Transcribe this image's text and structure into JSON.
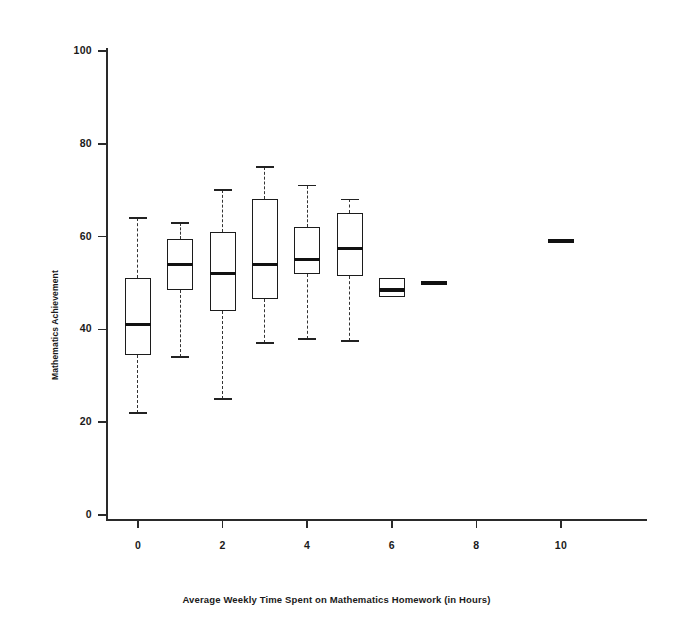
{
  "chart_data": {
    "type": "box",
    "title": "",
    "xlabel": "Average Weekly Time Spent on Mathematics Homework (in Hours)",
    "ylabel": "Mathematics Achievement",
    "xlim": [
      -0.7,
      10.7
    ],
    "ylim": [
      0,
      104
    ],
    "grid": false,
    "legend": null,
    "xticks": [
      0,
      2,
      4,
      6,
      8,
      10
    ],
    "xtick_labels": [
      "0",
      "2",
      "4",
      "6",
      "8",
      "10"
    ],
    "yticks": [
      0,
      20,
      40,
      60,
      80,
      100
    ],
    "ytick_labels": [
      "0",
      "20",
      "40",
      "60",
      "80",
      "100"
    ],
    "categories": [
      "0",
      "1",
      "2",
      "3",
      "4",
      "5",
      "6",
      "7",
      "10"
    ],
    "boxes": [
      {
        "x": 0,
        "whisker_low": 22,
        "q1": 34.5,
        "median": 41,
        "q3": 51,
        "whisker_high": 64,
        "degenerate": false
      },
      {
        "x": 1,
        "whisker_low": 34,
        "q1": 48.5,
        "median": 54,
        "q3": 59.5,
        "whisker_high": 63,
        "degenerate": false
      },
      {
        "x": 2,
        "whisker_low": 25,
        "q1": 44,
        "median": 52,
        "q3": 61,
        "whisker_high": 70,
        "degenerate": false
      },
      {
        "x": 3,
        "whisker_low": 37,
        "q1": 46.5,
        "median": 54,
        "q3": 68,
        "whisker_high": 75,
        "degenerate": false
      },
      {
        "x": 4,
        "whisker_low": 38,
        "q1": 52,
        "median": 55,
        "q3": 62,
        "whisker_high": 71,
        "degenerate": false
      },
      {
        "x": 5,
        "whisker_low": 37.5,
        "q1": 51.5,
        "median": 57.5,
        "q3": 65,
        "whisker_high": 68,
        "degenerate": false
      },
      {
        "x": 6,
        "whisker_low": 47,
        "q1": 47,
        "median": 48.5,
        "q3": 51,
        "whisker_high": 51,
        "degenerate": false
      },
      {
        "x": 7,
        "whisker_low": 50,
        "q1": 50,
        "median": 50,
        "q3": 50,
        "whisker_high": 50,
        "degenerate": true
      },
      {
        "x": 10,
        "whisker_low": 59,
        "q1": 59,
        "median": 59,
        "q3": 59,
        "whisker_high": 59,
        "degenerate": true
      }
    ]
  },
  "colors": {
    "axis": "#2a2a2a",
    "box_stroke": "#1c1c1c",
    "median": "#111111",
    "whisker": "#333333",
    "background": "#ffffff"
  }
}
